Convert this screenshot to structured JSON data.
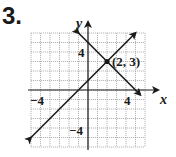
{
  "problem": {
    "number": "3."
  },
  "chart_data": {
    "type": "line",
    "title": "",
    "xlabel": "x",
    "ylabel": "y",
    "xlim": [
      -6,
      6
    ],
    "ylim": [
      -6,
      6
    ],
    "grid": true,
    "tick_labels": {
      "x": [
        "-4",
        "4"
      ],
      "y": [
        "4",
        "-4"
      ]
    },
    "series": [
      {
        "name": "line 1 (y = x + 1)",
        "points": [
          [
            -6,
            -5
          ],
          [
            5,
            6
          ]
        ],
        "arrows": "both"
      },
      {
        "name": "line 2 (y = -x + 5)",
        "points": [
          [
            -1,
            6
          ],
          [
            5.5,
            -0.5
          ]
        ],
        "arrows": "both"
      }
    ],
    "annotations": [
      {
        "text": "(2, 3)",
        "point": [
          2,
          3
        ],
        "marker": "dot"
      }
    ]
  },
  "labels": {
    "x_axis": "x",
    "y_axis": "y",
    "x_tick_neg": "−4",
    "x_tick_pos": "4",
    "y_tick_pos": "4",
    "y_tick_neg": "−4",
    "intersection": "(2, 3)"
  }
}
